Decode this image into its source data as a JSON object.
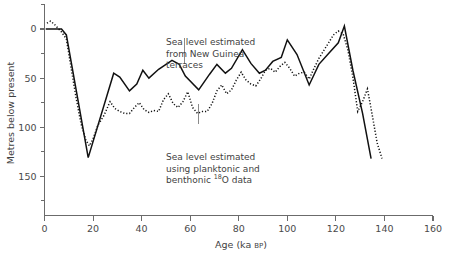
{
  "chart_data": {
    "type": "line",
    "title": "",
    "xlabel": "Age (ka BP)",
    "ylabel": "Metres below present",
    "xlim": [
      0,
      160
    ],
    "ylim": [
      -25,
      190
    ],
    "y_inverted": true,
    "grid": false,
    "legend_position": "inline-annotations",
    "x_ticks": [
      0,
      20,
      40,
      60,
      80,
      100,
      120,
      140,
      160
    ],
    "x_ticklabels": [
      "0",
      "20",
      "40",
      "60",
      "80",
      "100",
      "120",
      "140",
      "160"
    ],
    "y_ticks": [
      0,
      50,
      100,
      150
    ],
    "y_ticklabels": [
      "0",
      "50",
      "100",
      "150"
    ],
    "y_minor_ticks": [
      -25,
      25,
      75,
      125,
      175
    ],
    "series": [
      {
        "name": "Sea level estimated from New Guinea terraces",
        "style": "solid",
        "color": "#111111",
        "x": [
          0.5,
          4,
          7,
          9,
          18,
          28.5,
          31,
          35,
          38,
          40.5,
          43,
          47,
          52.5,
          55.5,
          58,
          63.5,
          68,
          71,
          74.5,
          77,
          81.5,
          85,
          88.5,
          91,
          94,
          97.5,
          100,
          104,
          109,
          113,
          117,
          121,
          123.5,
          127,
          131,
          134.5
        ],
        "y": [
          0,
          0,
          0,
          6,
          131,
          45,
          49,
          63,
          56,
          42,
          50,
          41,
          32,
          36,
          48,
          62,
          46,
          36,
          45,
          40,
          21,
          35,
          45,
          42,
          33,
          29,
          11,
          26,
          57,
          36,
          25,
          14,
          -3,
          42,
          86,
          132
        ]
      },
      {
        "name": "Sea level estimated using planktonic and benthonic 18O data",
        "style": "dotted",
        "color": "#111111",
        "x": [
          1,
          2.5,
          4,
          5.5,
          7,
          9,
          11,
          13,
          15,
          17,
          18.5,
          20,
          22,
          24.5,
          27,
          29,
          31,
          33,
          35,
          37,
          39,
          41,
          43,
          45,
          47,
          49,
          51,
          53,
          55,
          57,
          59,
          61,
          63,
          65,
          67,
          69,
          71,
          73,
          75,
          77,
          79,
          81,
          83,
          85,
          87,
          89,
          91,
          93,
          95,
          97,
          99,
          101,
          103,
          105,
          107,
          109,
          111,
          113,
          115,
          117,
          119,
          121,
          123,
          125,
          127,
          129,
          131,
          133,
          135,
          137,
          139
        ],
        "y": [
          -6,
          -8,
          -5,
          -1,
          3,
          10,
          40,
          70,
          96,
          113,
          119,
          112,
          98,
          88,
          74,
          81,
          84,
          86,
          86,
          80,
          75,
          82,
          85,
          83,
          84,
          72,
          66,
          76,
          80,
          74,
          64,
          80,
          86,
          84,
          84,
          76,
          63,
          57,
          66,
          62,
          52,
          44,
          52,
          56,
          58,
          51,
          42,
          40,
          44,
          38,
          34,
          40,
          48,
          45,
          44,
          51,
          40,
          30,
          22,
          14,
          6,
          2,
          5,
          22,
          49,
          84,
          74,
          61,
          88,
          116,
          132
        ]
      }
    ],
    "annotations": [
      {
        "id": "terraces-note",
        "lines": [
          "Sea level estimated",
          "from New Guinea",
          "terraces"
        ],
        "leader_from": [
          57.5,
          9
        ],
        "leader_to": [
          57.5,
          36
        ]
      },
      {
        "id": "isotope-note",
        "lines": [
          "Sea level estimated",
          "using planktonic and",
          "benthonic ",
          "O data"
        ],
        "superscript": "18",
        "leader_from": [
          63.5,
          76
        ],
        "leader_to": [
          63.5,
          97
        ]
      }
    ]
  },
  "labels": {
    "ylabel": "Metres below present",
    "xlabel_main": "Age (ka ",
    "xlabel_bp": "BP",
    "xlabel_close": ")",
    "anno1_l1": "Sea level estimated",
    "anno1_l2": "from New Guinea",
    "anno1_l3": "terraces",
    "anno2_l1": "Sea level estimated",
    "anno2_l2": "using planktonic and",
    "anno2_l3a": "benthonic ",
    "anno2_sup": "18",
    "anno2_l3b": "O data"
  }
}
